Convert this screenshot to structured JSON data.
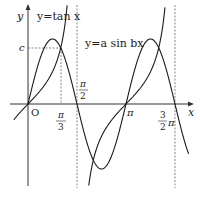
{
  "diagram": {
    "labels": {
      "y_axis": "y",
      "x_axis": "x",
      "origin": "O",
      "c": "c",
      "tan_curve": "y=tan x",
      "sin_curve": "y=a sin bx",
      "pi_over_3_num": "π",
      "pi_over_3_den": "3",
      "pi_over_2_num": "π",
      "pi_over_2_den": "2",
      "pi": "π",
      "three_half_num": "3",
      "three_half_den": "2",
      "three_half_pi": "π"
    },
    "colors": {
      "curve": "#1a1a1a",
      "axis": "#333333",
      "dashed": "#555555"
    }
  },
  "chart_data": {
    "type": "line",
    "title": "",
    "xlabel": "x",
    "ylabel": "y",
    "x_ticks": [
      "π/3",
      "π/2",
      "π",
      "3/2π"
    ],
    "y_ticks": [
      "c"
    ],
    "series": [
      {
        "name": "y=tan x",
        "function": "tan(x)",
        "domain": [
          -0.5,
          4.6
        ]
      },
      {
        "name": "y=a sin bx",
        "function": "a*sin(2x)",
        "b": 2,
        "domain": [
          0,
          5.0
        ]
      }
    ],
    "intersections": [
      {
        "x": "π/3",
        "y": "c"
      },
      {
        "x": "π",
        "y": 0
      },
      {
        "x": "4π/3",
        "y": "c"
      }
    ],
    "asymptotes": [
      "π/2",
      "3π/2"
    ],
    "grid": false
  }
}
